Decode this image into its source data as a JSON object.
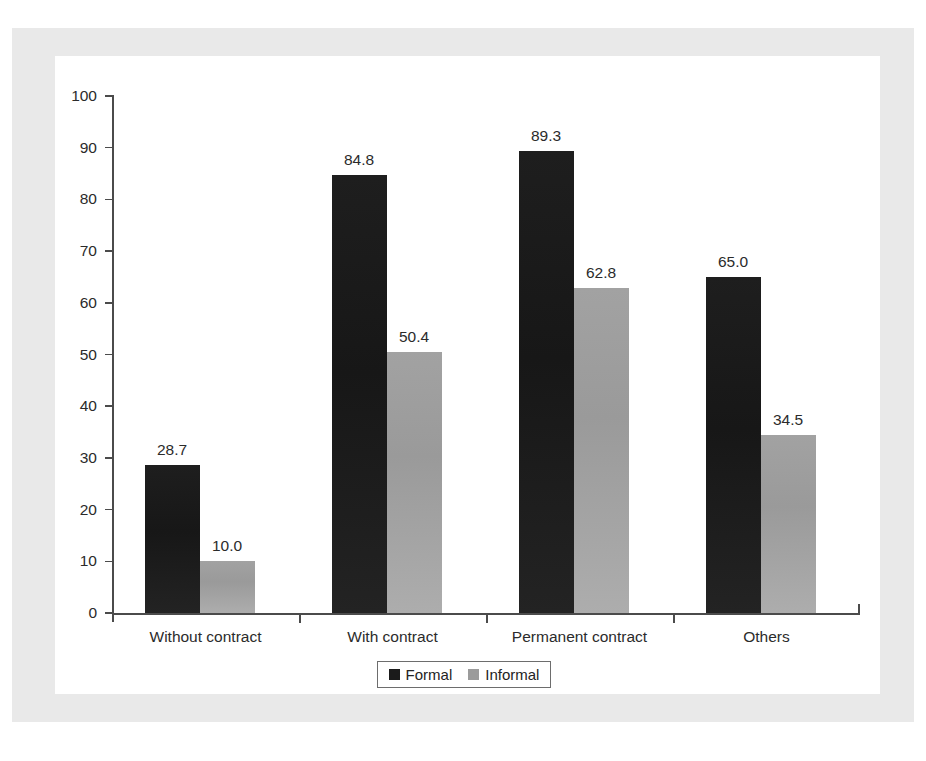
{
  "chart_data": {
    "type": "bar",
    "title": "",
    "subtitle": "",
    "xlabel": "",
    "ylabel": "",
    "categories": [
      "Without contract",
      "With contract",
      "Permanent contract",
      "Others"
    ],
    "series": [
      {
        "name": "Formal",
        "color": "#1b1b1b",
        "values": [
          28.7,
          84.8,
          89.3,
          65.0
        ],
        "value_labels": [
          "28.7",
          "84.8",
          "89.3",
          "65.0"
        ]
      },
      {
        "name": "Informal",
        "color": "#9b9b9b",
        "values": [
          10.0,
          50.4,
          62.8,
          34.5
        ],
        "value_labels": [
          "10.0",
          "50.4",
          "62.8",
          "34.5"
        ]
      }
    ],
    "ylim": [
      0,
      100
    ],
    "ytick_values": [
      0,
      10,
      20,
      30,
      40,
      50,
      60,
      70,
      80,
      90,
      100
    ],
    "ytick_labels": [
      "0",
      "10",
      "20",
      "30",
      "40",
      "50",
      "60",
      "70",
      "80",
      "90",
      "100"
    ],
    "grid": false,
    "legend_position": "bottom-center",
    "legend_entries": [
      "Formal",
      "Informal"
    ]
  },
  "colors": {
    "formal": "#1b1b1b",
    "informal": "#9b9b9b",
    "axis": "#4b4b4b",
    "text": "#2b2b2b",
    "page_border": "#e9e9e9",
    "background": "#ffffff"
  }
}
